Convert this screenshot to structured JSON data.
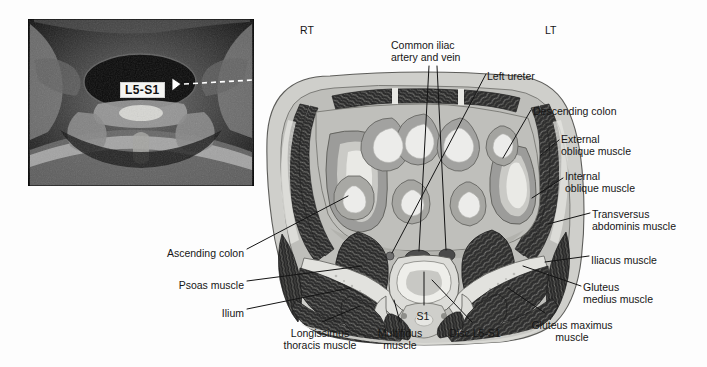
{
  "figure": {
    "type": "anatomical-cross-section",
    "region": "Axial section at the L5-S1 intervertebral disc level",
    "orientation_markers": [
      {
        "name": "right-marker",
        "text": "RT",
        "x": 300,
        "y": 24
      },
      {
        "name": "left-marker",
        "text": "LT",
        "x": 545,
        "y": 24
      }
    ]
  },
  "mri_inset": {
    "name": "lumbar-mri-axial",
    "modality": "MRI",
    "overlay_label": "L5-S1",
    "pointer": "dashed-line-with-arrowhead",
    "bounds": {
      "x": 28,
      "y": 19,
      "width": 226,
      "height": 167
    }
  },
  "labels": [
    {
      "name": "label-common-iliac-artery-and-vein",
      "lines": [
        "Common iliac",
        "artery and vein"
      ],
      "align": "left",
      "x": 391,
      "y": 39
    },
    {
      "name": "label-left-ureter",
      "lines": [
        "Left ureter"
      ],
      "align": "left",
      "x": 487,
      "y": 70
    },
    {
      "name": "label-descending-colon",
      "lines": [
        "Descending colon"
      ],
      "align": "left",
      "x": 533,
      "y": 105
    },
    {
      "name": "label-external-oblique-muscle",
      "lines": [
        "External",
        "oblique muscle"
      ],
      "align": "left",
      "x": 561,
      "y": 133
    },
    {
      "name": "label-internal-oblique-muscle",
      "lines": [
        "Internal",
        "oblique muscle"
      ],
      "align": "left",
      "x": 565,
      "y": 170
    },
    {
      "name": "label-transversus-abdominis-muscle",
      "lines": [
        "Transversus",
        "abdominis muscle"
      ],
      "align": "left",
      "x": 592,
      "y": 208
    },
    {
      "name": "label-iliacus-muscle",
      "lines": [
        "Iliacus muscle"
      ],
      "align": "left",
      "x": 591,
      "y": 254
    },
    {
      "name": "label-gluteus-medius-muscle",
      "lines": [
        "Gluteus",
        "medius muscle"
      ],
      "align": "left",
      "x": 583,
      "y": 281
    },
    {
      "name": "label-gluteus-maximus-muscle",
      "lines": [
        "Gluteus maximus",
        "muscle"
      ],
      "align": "center",
      "x": 572,
      "y": 319
    },
    {
      "name": "label-ascending-colon",
      "lines": [
        "Ascending colon"
      ],
      "align": "right",
      "x": 244,
      "y": 247
    },
    {
      "name": "label-psoas-muscle",
      "lines": [
        "Psoas muscle"
      ],
      "align": "right",
      "x": 244,
      "y": 279
    },
    {
      "name": "label-ilium",
      "lines": [
        "Ilium"
      ],
      "align": "right",
      "x": 244,
      "y": 307
    },
    {
      "name": "label-longissimus-thoracis-muscle",
      "lines": [
        "Longissimus",
        "thoracis muscle"
      ],
      "align": "center",
      "x": 320,
      "y": 327
    },
    {
      "name": "label-multifidus-muscle",
      "lines": [
        "Multifidus",
        "muscle"
      ],
      "align": "center",
      "x": 400,
      "y": 327
    },
    {
      "name": "label-s1",
      "lines": [
        "S1"
      ],
      "align": "center",
      "x": 423,
      "y": 310
    },
    {
      "name": "label-disc-l5-s1",
      "lines": [
        "Disc L5-S1"
      ],
      "align": "center",
      "x": 475,
      "y": 327
    }
  ],
  "colors": {
    "background": "#fdfdfd",
    "skin_fat": "#cfcfcb",
    "deep_fat": "#bcbcb8",
    "bowel_wall": "#9a9a98",
    "bowel_lumen": "#e9e9e6",
    "muscle_dark": "#2c2c2c",
    "bone": "#dedede",
    "vessel": "#5a5a5a",
    "leader_line": "#1a1a1a",
    "text": "#161616"
  }
}
